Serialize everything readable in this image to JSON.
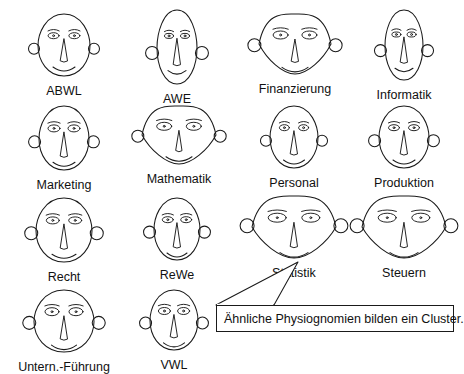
{
  "diagram": {
    "kind": "chernoff-faces",
    "background_color": "#ffffff",
    "stroke_color": "#1a1a1a",
    "text_color": "#111111"
  },
  "faces": [
    {
      "label": "ABWL",
      "x": 14,
      "y": 6,
      "cell_w": 100,
      "cell_h": 86,
      "face_w": 52,
      "face_h": 62,
      "shape": "oval",
      "eye_w": 11,
      "eye_h": 6,
      "pupil": true,
      "brow": true,
      "ear_r": 5.5,
      "ear_y": 0.56,
      "nose_h": 22,
      "nose_w": 7,
      "mouth_w": 22,
      "mouth_curve": 8
    },
    {
      "label": "AWE",
      "x": 127,
      "y": 2,
      "cell_w": 100,
      "cell_h": 90,
      "face_w": 40,
      "face_h": 74,
      "shape": "oval",
      "eye_w": 9,
      "eye_h": 5,
      "pupil": true,
      "brow": true,
      "ear_r": 6.5,
      "ear_y": 0.58,
      "nose_h": 26,
      "nose_w": 7,
      "mouth_w": 18,
      "mouth_curve": 7
    },
    {
      "label": "Finanzierung",
      "x": 240,
      "y": 6,
      "cell_w": 110,
      "cell_h": 86,
      "face_w": 72,
      "face_h": 60,
      "shape": "lens",
      "eye_w": 15,
      "eye_h": 8,
      "pupil": true,
      "brow": true,
      "ear_r": 6.5,
      "ear_y": 0.52,
      "nose_h": 22,
      "nose_w": 7,
      "mouth_w": 26,
      "mouth_curve": 9
    },
    {
      "label": "Informatik",
      "x": 356,
      "y": 2,
      "cell_w": 96,
      "cell_h": 90,
      "face_w": 38,
      "face_h": 70,
      "shape": "oval",
      "eye_w": 9,
      "eye_h": 5,
      "pupil": true,
      "brow": true,
      "ear_r": 6,
      "ear_y": 0.58,
      "nose_h": 25,
      "nose_w": 7,
      "mouth_w": 18,
      "mouth_curve": 7
    },
    {
      "label": "Marketing",
      "x": 14,
      "y": 98,
      "cell_w": 100,
      "cell_h": 86,
      "face_w": 50,
      "face_h": 64,
      "shape": "oval",
      "eye_w": 12,
      "eye_h": 7,
      "pupil": true,
      "brow": true,
      "ear_r": 6,
      "ear_y": 0.56,
      "nose_h": 24,
      "nose_w": 7,
      "mouth_w": 22,
      "mouth_curve": 8
    },
    {
      "label": "Mathematik",
      "x": 124,
      "y": 98,
      "cell_w": 110,
      "cell_h": 86,
      "face_w": 74,
      "face_h": 58,
      "shape": "lens",
      "eye_w": 15,
      "eye_h": 8,
      "pupil": true,
      "brow": true,
      "ear_r": 6,
      "ear_y": 0.52,
      "nose_h": 20,
      "nose_w": 6,
      "mouth_w": 26,
      "mouth_curve": 9
    },
    {
      "label": "Personal",
      "x": 246,
      "y": 98,
      "cell_w": 96,
      "cell_h": 86,
      "face_w": 48,
      "face_h": 62,
      "shape": "oval",
      "eye_w": 10,
      "eye_h": 6,
      "pupil": true,
      "brow": true,
      "ear_r": 5.5,
      "ear_y": 0.56,
      "nose_h": 23,
      "nose_w": 7,
      "mouth_w": 21,
      "mouth_curve": 8
    },
    {
      "label": "Produktion",
      "x": 356,
      "y": 98,
      "cell_w": 96,
      "cell_h": 86,
      "face_w": 50,
      "face_h": 62,
      "shape": "oval",
      "eye_w": 11,
      "eye_h": 6,
      "pupil": true,
      "brow": true,
      "ear_r": 6,
      "ear_y": 0.56,
      "nose_h": 23,
      "nose_w": 7,
      "mouth_w": 22,
      "mouth_curve": 8
    },
    {
      "label": "Recht",
      "x": 14,
      "y": 190,
      "cell_w": 100,
      "cell_h": 86,
      "face_w": 56,
      "face_h": 64,
      "shape": "oval",
      "eye_w": 13,
      "eye_h": 7,
      "pupil": true,
      "brow": true,
      "ear_r": 6.5,
      "ear_y": 0.55,
      "nose_h": 24,
      "nose_w": 7,
      "mouth_w": 24,
      "mouth_curve": 8
    },
    {
      "label": "ReWe",
      "x": 127,
      "y": 190,
      "cell_w": 100,
      "cell_h": 86,
      "face_w": 46,
      "face_h": 62,
      "shape": "oval",
      "eye_w": 11,
      "eye_h": 6,
      "pupil": true,
      "brow": true,
      "ear_r": 6,
      "ear_y": 0.55,
      "nose_h": 24,
      "nose_w": 7,
      "mouth_w": 20,
      "mouth_curve": 8
    },
    {
      "label": "Statistik",
      "x": 238,
      "y": 188,
      "cell_w": 112,
      "cell_h": 88,
      "face_w": 84,
      "face_h": 62,
      "shape": "lens",
      "eye_w": 18,
      "eye_h": 9,
      "pupil": true,
      "brow": true,
      "ear_r": 7,
      "ear_y": 0.48,
      "nose_h": 24,
      "nose_w": 7,
      "mouth_w": 28,
      "mouth_curve": 9
    },
    {
      "label": "Steuern",
      "x": 348,
      "y": 188,
      "cell_w": 112,
      "cell_h": 88,
      "face_w": 84,
      "face_h": 62,
      "shape": "lens",
      "eye_w": 18,
      "eye_h": 9,
      "pupil": true,
      "brow": true,
      "ear_r": 7,
      "ear_y": 0.48,
      "nose_h": 24,
      "nose_w": 7,
      "mouth_w": 28,
      "mouth_curve": 9
    },
    {
      "label": "Untern.-Führung",
      "x": 8,
      "y": 282,
      "cell_w": 112,
      "cell_h": 86,
      "face_w": 60,
      "face_h": 62,
      "shape": "oval",
      "eye_w": 14,
      "eye_h": 8,
      "pupil": true,
      "brow": true,
      "ear_r": 6.5,
      "ear_y": 0.53,
      "nose_h": 23,
      "nose_w": 7,
      "mouth_w": 25,
      "mouth_curve": 9
    },
    {
      "label": "VWL",
      "x": 124,
      "y": 282,
      "cell_w": 100,
      "cell_h": 86,
      "face_w": 48,
      "face_h": 60,
      "shape": "oval",
      "eye_w": 12,
      "eye_h": 7,
      "pupil": true,
      "brow": true,
      "ear_r": 6,
      "ear_y": 0.55,
      "nose_h": 22,
      "nose_w": 7,
      "mouth_w": 21,
      "mouth_curve": 8
    }
  ],
  "callout": {
    "text": "Ähnliche Physiognomien bilden ein Cluster.",
    "box": {
      "x": 216,
      "y": 305,
      "w": 238,
      "h": 27
    },
    "pointer_path": "M 216 305 L 298 262 L 274 305 Z",
    "tip": {
      "x": 298,
      "y": 262
    }
  }
}
